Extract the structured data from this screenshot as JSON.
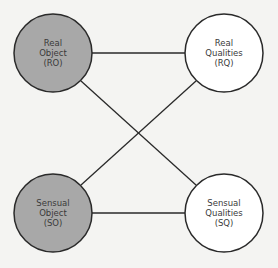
{
  "colors": {
    "background": "#f4f4f2",
    "stroke": "#2a2a2a",
    "filled_node": "#a8a8a8",
    "empty_node": "#ffffff",
    "text": "#3a3a3a"
  },
  "nodes": [
    {
      "id": "RO",
      "lines": [
        "Real",
        "Object",
        "(RO)"
      ],
      "filled": true
    },
    {
      "id": "RQ",
      "lines": [
        "Real",
        "Qualities",
        "(RQ)"
      ],
      "filled": false
    },
    {
      "id": "SO",
      "lines": [
        "Sensual",
        "Object",
        "(SO)"
      ],
      "filled": true
    },
    {
      "id": "SQ",
      "lines": [
        "Sensual",
        "Qualities",
        "(SQ)"
      ],
      "filled": false
    }
  ],
  "edges": [
    {
      "from": "RO",
      "to": "RQ"
    },
    {
      "from": "RO",
      "to": "SQ"
    },
    {
      "from": "SO",
      "to": "RQ"
    },
    {
      "from": "SO",
      "to": "SQ"
    }
  ]
}
